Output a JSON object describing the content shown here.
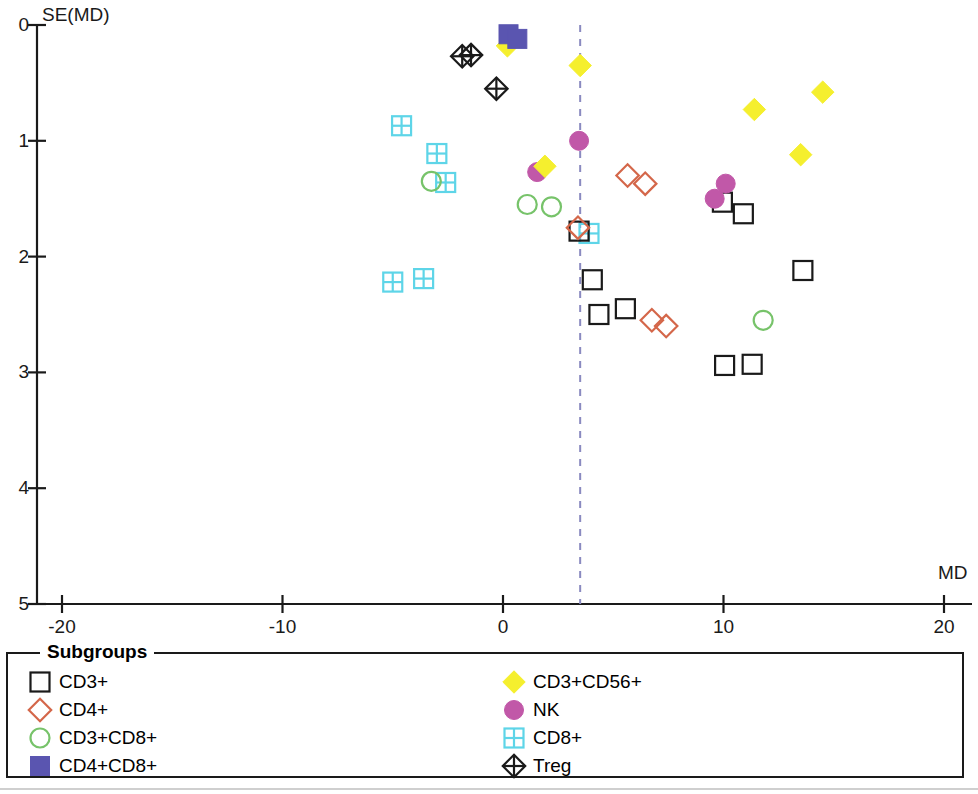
{
  "chart_data": {
    "type": "scatter",
    "title": "",
    "xlabel": "MD",
    "ylabel": "SE(MD)",
    "xlim": [
      -20,
      20
    ],
    "ylim": [
      0,
      5
    ],
    "y_axis_inverted": true,
    "grid": false,
    "xticks": [
      -20,
      -10,
      0,
      10,
      20
    ],
    "yticks": [
      0,
      1,
      2,
      3,
      4,
      5
    ],
    "reference_line": {
      "type": "vertical-dashed",
      "x": 3.5,
      "color": "#8a8ac0"
    },
    "legend_title": "Subgroups",
    "legend_position": "bottom",
    "series": [
      {
        "name": "CD3+",
        "marker": "square-open",
        "color": "#1a1a1a",
        "fill": "none",
        "points": [
          [
            3.45,
            1.78
          ],
          [
            4.05,
            2.2
          ],
          [
            4.35,
            2.5
          ],
          [
            5.55,
            2.45
          ],
          [
            9.95,
            1.53
          ],
          [
            10.9,
            1.63
          ],
          [
            13.6,
            2.12
          ],
          [
            10.05,
            2.94
          ],
          [
            11.3,
            2.93
          ]
        ]
      },
      {
        "name": "CD4+",
        "marker": "diamond-open",
        "color": "#d4674a",
        "fill": "none",
        "points": [
          [
            3.4,
            1.75
          ],
          [
            5.65,
            1.3
          ],
          [
            6.45,
            1.37
          ],
          [
            6.75,
            2.55
          ],
          [
            7.4,
            2.6
          ]
        ]
      },
      {
        "name": "CD3+CD8+",
        "marker": "circle-open",
        "color": "#77c36a",
        "fill": "none",
        "points": [
          [
            -3.25,
            1.35
          ],
          [
            1.1,
            1.55
          ],
          [
            2.2,
            1.57
          ],
          [
            11.8,
            2.55
          ]
        ]
      },
      {
        "name": "CD4+CD8+",
        "marker": "square-filled",
        "color": "#5a55b0",
        "fill": "#5a55b0",
        "points": [
          [
            0.25,
            0.08
          ],
          [
            0.65,
            0.12
          ]
        ]
      },
      {
        "name": "CD3+CD56+",
        "marker": "diamond-filled",
        "color": "#f5ef2e",
        "fill": "#f5ef2e",
        "points": [
          [
            0.2,
            0.18
          ],
          [
            3.5,
            0.35
          ],
          [
            1.9,
            1.22
          ],
          [
            11.4,
            0.73
          ],
          [
            14.5,
            0.58
          ],
          [
            13.5,
            1.12
          ]
        ]
      },
      {
        "name": "NK",
        "marker": "circle-filled",
        "color": "#c158a8",
        "fill": "#c158a8",
        "points": [
          [
            3.45,
            1.0
          ],
          [
            1.55,
            1.27
          ],
          [
            9.6,
            1.5
          ],
          [
            10.1,
            1.37
          ]
        ]
      },
      {
        "name": "CD8+",
        "marker": "square-grid",
        "color": "#5ed5e8",
        "fill": "none",
        "points": [
          [
            -4.6,
            0.87
          ],
          [
            -3.0,
            1.11
          ],
          [
            -2.6,
            1.36
          ],
          [
            -5.0,
            2.22
          ],
          [
            -3.6,
            2.19
          ],
          [
            3.9,
            1.8
          ]
        ]
      },
      {
        "name": "Treg",
        "marker": "diamond-cross",
        "color": "#1a1a1a",
        "fill": "none",
        "points": [
          [
            -1.85,
            0.27
          ],
          [
            -1.45,
            0.26
          ],
          [
            -0.3,
            0.55
          ]
        ]
      }
    ]
  },
  "axes": {
    "y_title": "SE(MD)",
    "x_title": "MD",
    "y_tick_labels": [
      "0",
      "1",
      "2",
      "3",
      "4",
      "5"
    ],
    "x_tick_labels": [
      "-20",
      "-10",
      "0",
      "10",
      "20"
    ]
  },
  "legend": {
    "title": "Subgroups",
    "left_items": [
      {
        "label": "CD3+",
        "marker": "square-open",
        "color": "#1a1a1a"
      },
      {
        "label": "CD4+",
        "marker": "diamond-open",
        "color": "#d4674a"
      },
      {
        "label": "CD3+CD8+",
        "marker": "circle-open",
        "color": "#77c36a"
      },
      {
        "label": "CD4+CD8+",
        "marker": "square-filled",
        "color": "#5a55b0"
      }
    ],
    "right_items": [
      {
        "label": "CD3+CD56+",
        "marker": "diamond-filled",
        "color": "#f5ef2e"
      },
      {
        "label": "NK",
        "marker": "circle-filled",
        "color": "#c158a8"
      },
      {
        "label": "CD8+",
        "marker": "square-grid",
        "color": "#5ed5e8"
      },
      {
        "label": "Treg",
        "marker": "diamond-cross",
        "color": "#1a1a1a"
      }
    ]
  }
}
